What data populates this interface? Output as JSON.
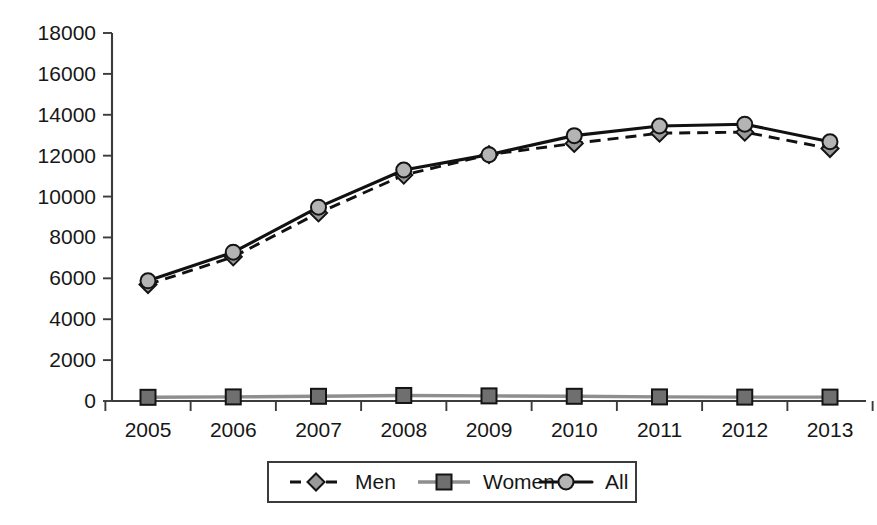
{
  "chart_data": {
    "type": "line",
    "title": "",
    "subtitle": "",
    "xlabel": "",
    "ylabel": "",
    "categories": [
      "2005",
      "2006",
      "2007",
      "2008",
      "2009",
      "2010",
      "2011",
      "2012",
      "2013"
    ],
    "series": [
      {
        "name": "Men",
        "marker": "diamond",
        "line": "dashed",
        "color": "#111111",
        "marker_color": "#9a9a9a",
        "values": [
          5700,
          7050,
          9200,
          11050,
          12050,
          12600,
          13100,
          13150,
          12350
        ]
      },
      {
        "name": "Women",
        "marker": "square",
        "line": "solid",
        "color": "#8e8e8e",
        "marker_color": "#6f6f6f",
        "values": [
          180,
          200,
          230,
          270,
          250,
          230,
          200,
          190,
          190
        ]
      },
      {
        "name": "All",
        "marker": "circle",
        "line": "solid",
        "color": "#111111",
        "marker_color": "#b4b4b4",
        "values": [
          5880,
          7280,
          9480,
          11300,
          12050,
          12980,
          13450,
          13540,
          12680
        ]
      }
    ],
    "ylim": [
      0,
      18000
    ],
    "ytick_values": [
      0,
      2000,
      4000,
      6000,
      8000,
      10000,
      12000,
      14000,
      16000,
      18000
    ],
    "ytick_labels": [
      "0",
      "2000",
      "4000",
      "6000",
      "8000",
      "10000",
      "12000",
      "14000",
      "16000",
      "18000"
    ],
    "xtick_labels": [
      "2005",
      "2006",
      "2007",
      "2008",
      "2009",
      "2010",
      "2011",
      "2012",
      "2013"
    ],
    "grid": false,
    "legend_position": "bottom-center",
    "legend_entries": [
      "Men",
      "Women",
      "All"
    ]
  },
  "legend": {
    "items": [
      {
        "label": "Men"
      },
      {
        "label": "Women"
      },
      {
        "label": "All"
      }
    ]
  },
  "axes": {
    "y_axis_name": "value-axis",
    "x_axis_name": "year-axis"
  }
}
